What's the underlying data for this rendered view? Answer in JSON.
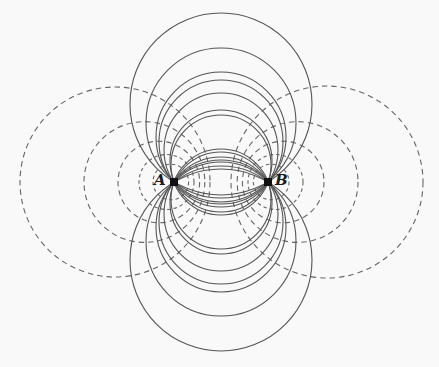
{
  "diagram": {
    "points": [
      {
        "label": "A",
        "x": 174,
        "y": 182
      },
      {
        "label": "B",
        "x": 268,
        "y": 182
      }
    ],
    "colors": {
      "background": "#f9f9f9",
      "solid_stroke": "#555555",
      "dashed_stroke": "#666666",
      "point_fill": "#111111",
      "label": "#1a1a1a"
    },
    "solid_circles": [
      {
        "cx": 221,
        "cy": 104,
        "r": 91
      },
      {
        "cx": 221,
        "cy": 123,
        "r": 75
      },
      {
        "cx": 221,
        "cy": 142,
        "r": 62
      },
      {
        "cx": 221,
        "cy": 161,
        "r": 51
      },
      {
        "cx": 221,
        "cy": 199,
        "r": 50
      },
      {
        "cx": 221,
        "cy": 214,
        "r": 57
      },
      {
        "cx": 221,
        "cy": 227,
        "r": 65
      },
      {
        "cx": 221,
        "cy": 260,
        "r": 91
      },
      {
        "cx": 221,
        "cy": 241,
        "r": 75
      },
      {
        "cx": 221,
        "cy": 222,
        "r": 62
      },
      {
        "cx": 221,
        "cy": 203,
        "r": 51
      },
      {
        "cx": 221,
        "cy": 165,
        "r": 50
      },
      {
        "cx": 221,
        "cy": 150,
        "r": 57
      },
      {
        "cx": 221,
        "cy": 137,
        "r": 65
      }
    ],
    "dashed_circles": [
      {
        "cx": 115,
        "cy": 182,
        "r": 95
      },
      {
        "cx": 144.4,
        "cy": 182,
        "r": 60.4
      },
      {
        "cx": 158.8,
        "cy": 182,
        "r": 40.8
      },
      {
        "cx": 166.5,
        "cy": 182,
        "r": 27.5
      },
      {
        "cx": 170.8,
        "cy": 182,
        "r": 17.8
      },
      {
        "cx": 327,
        "cy": 182,
        "r": 96
      },
      {
        "cx": 297.6,
        "cy": 182,
        "r": 60.4
      },
      {
        "cx": 283.2,
        "cy": 182,
        "r": 40.8
      },
      {
        "cx": 275.5,
        "cy": 182,
        "r": 27.5
      },
      {
        "cx": 271.2,
        "cy": 182,
        "r": 17.8
      }
    ]
  }
}
